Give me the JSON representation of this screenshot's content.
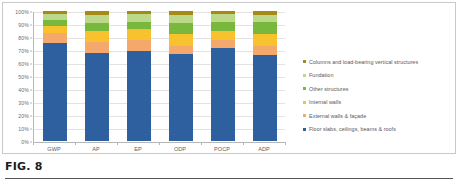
{
  "caption": {
    "label": "FIG. 8"
  },
  "chart_data": {
    "type": "bar",
    "subtype": "100% stacked column",
    "title": "",
    "xlabel": "",
    "ylabel": "",
    "ylim": [
      0,
      100
    ],
    "ytick_labels": [
      "100%",
      "90%",
      "80%",
      "70%",
      "60%",
      "50%",
      "40%",
      "30%",
      "20%",
      "10%",
      "0%"
    ],
    "ytick_values": [
      100,
      90,
      80,
      70,
      60,
      50,
      40,
      30,
      20,
      10,
      0
    ],
    "grid": true,
    "grid_axis": "y",
    "legend_position": "right",
    "categories": [
      "GWP",
      "AP",
      "EP",
      "ODP",
      "POCP",
      "ADP"
    ],
    "series": [
      {
        "name": "Floor slabs, ceilings, beams & roofs",
        "color": "#2e5f9e",
        "values": [
          75.5,
          67.5,
          69.5,
          67.0,
          71.5,
          66.5
        ]
      },
      {
        "name": "External walls & façade",
        "color": "#f5a86b",
        "values": [
          7.5,
          9.0,
          8.0,
          6.0,
          6.0,
          6.5
        ]
      },
      {
        "name": "Internal walls",
        "color": "#f7c22e",
        "values": [
          5.5,
          8.0,
          8.5,
          9.0,
          7.5,
          9.5
        ]
      },
      {
        "name": "Other structures",
        "color": "#78b83c",
        "values": [
          4.5,
          6.5,
          5.5,
          9.0,
          6.5,
          9.0
        ]
      },
      {
        "name": "Fundation",
        "color": "#bcd98a",
        "values": [
          5.0,
          6.0,
          6.5,
          6.0,
          6.0,
          5.5
        ]
      },
      {
        "name": "Columns and load-bearing vertical structures",
        "color": "#a58b16",
        "values": [
          2.0,
          3.0,
          2.0,
          3.0,
          2.5,
          3.0
        ]
      }
    ]
  },
  "legend": {
    "items": [
      {
        "label": "Columns and load-bearing vertical structures",
        "color": "#a58b16"
      },
      {
        "label": "Fundation",
        "color": "#bcd98a"
      },
      {
        "label": "Other structures",
        "color": "#78b83c"
      },
      {
        "label": "Internal walls",
        "color": "#f7c22e"
      },
      {
        "label": "External walls & façade",
        "color": "#f5a86b"
      },
      {
        "label": "Floor slabs, ceilings, beams & roofs",
        "color": "#2e5f9e"
      }
    ]
  }
}
